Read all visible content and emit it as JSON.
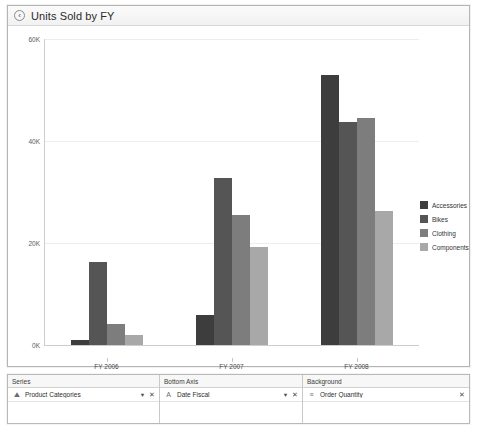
{
  "window": {
    "title": "Units Sold by FY",
    "back_icon": "back-arrow-icon"
  },
  "chart_data": {
    "type": "bar",
    "title": "Units Sold by FY",
    "xlabel": "",
    "ylabel": "",
    "categories": [
      "FY 2006",
      "FY 2007",
      "FY 2008"
    ],
    "series": [
      {
        "name": "Accessories",
        "color": "#3d3d3d",
        "values": [
          900,
          5800,
          53000
        ]
      },
      {
        "name": "Bikes",
        "color": "#555555",
        "values": [
          16200,
          32800,
          43800
        ]
      },
      {
        "name": "Clothing",
        "color": "#7d7d7d",
        "values": [
          4100,
          25400,
          44600
        ]
      },
      {
        "name": "Components",
        "color": "#a8a8a8",
        "values": [
          2000,
          19300,
          26200
        ]
      }
    ],
    "ylim": [
      0,
      60000
    ],
    "yticks": [
      "0K",
      "20K",
      "40K",
      "60K"
    ],
    "ytick_values": [
      0,
      20000,
      40000,
      60000
    ],
    "grid": true,
    "legend_position": "right"
  },
  "legend": {
    "items": [
      {
        "label": "Accessories"
      },
      {
        "label": "Bikes"
      },
      {
        "label": "Clothing"
      },
      {
        "label": "Components"
      }
    ]
  },
  "panels": [
    {
      "header": "Series",
      "field": "Product Categories",
      "icon": "category-field-icon",
      "dropdown": "▼",
      "close": "✕",
      "has_dropdown": true
    },
    {
      "header": "Bottom Axis",
      "field": "Date Fiscal",
      "icon": "date-field-icon",
      "dropdown": "▼",
      "close": "✕",
      "has_dropdown": true
    },
    {
      "header": "Background",
      "field": "Order Quantity",
      "icon": "measure-field-icon",
      "dropdown": "",
      "close": "✕",
      "has_dropdown": false
    }
  ]
}
